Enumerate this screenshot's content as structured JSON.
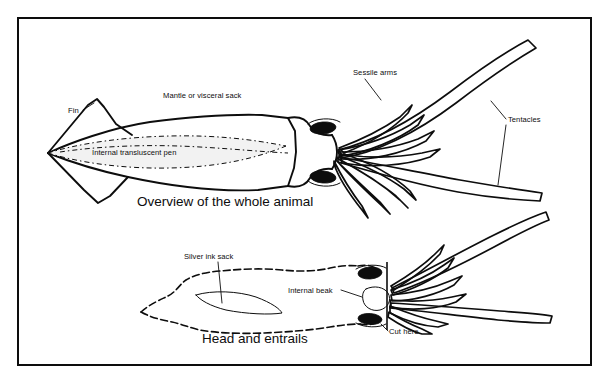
{
  "figure": {
    "background_color": "#ffffff",
    "ink_color": "#0d0d0d",
    "frame": {
      "border_color": "#0d0d0d",
      "border_width_px": 2
    }
  },
  "panels": [
    {
      "id": "whole-animal",
      "caption": "Overview of the whole animal",
      "labels": [
        {
          "key": "fin",
          "text": "Fin"
        },
        {
          "key": "mantle",
          "text": "Mantle or visceral sack"
        },
        {
          "key": "pen",
          "text": "Internal transluscent pen"
        },
        {
          "key": "sessile_arms",
          "text": "Sessile arms"
        },
        {
          "key": "tentacles",
          "text": "Tentacles"
        }
      ]
    },
    {
      "id": "head-and-entrails",
      "caption": "Head and entrails",
      "labels": [
        {
          "key": "ink_sack",
          "text": "Silver ink sack"
        },
        {
          "key": "beak",
          "text": "Internal beak"
        },
        {
          "key": "cut_here",
          "text": "Cut here"
        }
      ]
    }
  ],
  "icons": {
    "eye": "eye-ellipse-icon",
    "beak": "beak-ellipse-icon",
    "cut_marker": "cut-line-icon"
  }
}
